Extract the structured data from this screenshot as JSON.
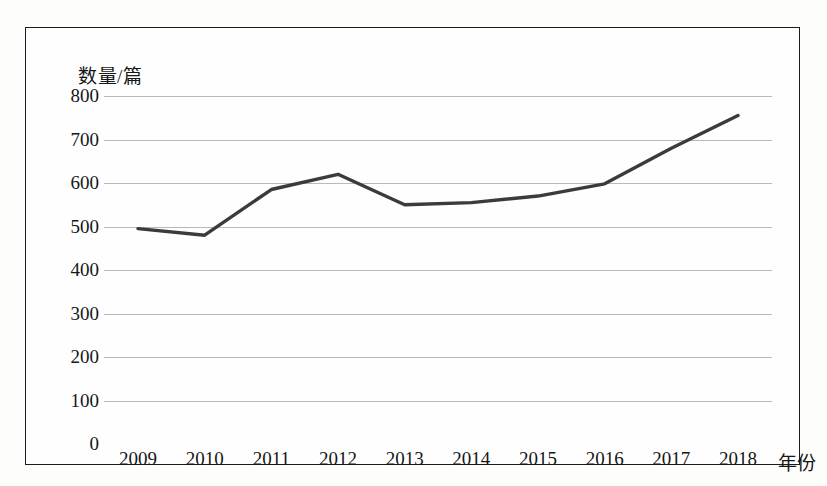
{
  "chart_data": {
    "type": "line",
    "title": "",
    "xlabel": "年份",
    "ylabel": "数量/篇",
    "categories": [
      "2009",
      "2010",
      "2011",
      "2012",
      "2013",
      "2014",
      "2015",
      "2016",
      "2017",
      "2018"
    ],
    "series": [
      {
        "name": "数量/篇",
        "values": [
          495,
          480,
          585,
          620,
          550,
          555,
          570,
          598,
          680,
          755
        ]
      }
    ],
    "ylim": [
      0,
      800
    ],
    "ytick_labels": [
      "800",
      "700",
      "600",
      "500",
      "400",
      "300",
      "200",
      "100",
      "0"
    ],
    "ytick_values": [
      800,
      700,
      600,
      500,
      400,
      300,
      200,
      100,
      0
    ],
    "grid": true,
    "legend": "none",
    "line_color": "#3b3b3b",
    "grid_color": "#b9b9b9",
    "border_color": "#1c1c1c",
    "background_color": "#fefefe"
  }
}
